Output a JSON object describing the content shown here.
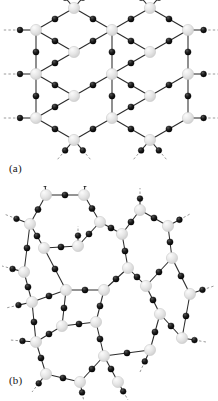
{
  "figure": {
    "background_color": "#ffffff",
    "panels": [
      {
        "id": "a",
        "label": "(a)",
        "caption_text": "(a)",
        "structure_name": "crystalline-honeycomb-network"
      },
      {
        "id": "b",
        "label": "(b)",
        "caption_text": "(b)",
        "structure_name": "amorphous-continuous-random-network"
      }
    ]
  },
  "style": {
    "node_large_fill": "#e2e2e2",
    "node_large_stroke": "#c9c9c9",
    "node_large_highlight": "#f7f7f7",
    "node_small_fill": "#161616",
    "node_small_stroke": "#000000",
    "bond_color": "#2b2b2b",
    "dangling_bond_color": "#9a9a9a",
    "label_color": "#151515"
  },
  "chart_data": {
    "type": "diagram",
    "title": "",
    "subtitle": "",
    "xlabel": "",
    "ylabel": "",
    "legend": [],
    "grid": false,
    "panels": [
      {
        "id": "a",
        "label": "(a)",
        "description": "Regular crystalline honeycomb network of three-fold coordinated large atoms bridged by small atoms; all rings are six-membered.",
        "ring_sizes": [
          6,
          6,
          6,
          6,
          6,
          6,
          6,
          6,
          6
        ],
        "ring_size_counts": {
          "6": 9
        },
        "coordination_number": 3,
        "large_nodes": [
          {
            "id": "A0",
            "x": 36,
            "y": 30
          },
          {
            "id": "A1",
            "x": 36,
            "y": 74
          },
          {
            "id": "A2",
            "x": 36,
            "y": 118
          },
          {
            "id": "A3",
            "x": 74,
            "y": 8
          },
          {
            "id": "A4",
            "x": 74,
            "y": 52
          },
          {
            "id": "A5",
            "x": 74,
            "y": 96
          },
          {
            "id": "A6",
            "x": 74,
            "y": 140
          },
          {
            "id": "A7",
            "x": 112,
            "y": 30
          },
          {
            "id": "A8",
            "x": 112,
            "y": 74
          },
          {
            "id": "A9",
            "x": 112,
            "y": 118
          },
          {
            "id": "A10",
            "x": 150,
            "y": 8
          },
          {
            "id": "A11",
            "x": 150,
            "y": 52
          },
          {
            "id": "A12",
            "x": 150,
            "y": 96
          },
          {
            "id": "A13",
            "x": 150,
            "y": 140
          },
          {
            "id": "A14",
            "x": 188,
            "y": 30
          },
          {
            "id": "A15",
            "x": 188,
            "y": 74
          },
          {
            "id": "A16",
            "x": 188,
            "y": 118
          }
        ],
        "bonds": [
          {
            "from": "A0",
            "to": "A3"
          },
          {
            "from": "A0",
            "to": "A4"
          },
          {
            "from": "A4",
            "to": "A7"
          },
          {
            "from": "A3",
            "to": "A7"
          },
          {
            "from": "A0",
            "to": "A1"
          },
          {
            "from": "A1",
            "to": "A4"
          },
          {
            "from": "A1",
            "to": "A5"
          },
          {
            "from": "A5",
            "to": "A8"
          },
          {
            "from": "A7",
            "to": "A8"
          },
          {
            "from": "A1",
            "to": "A2"
          },
          {
            "from": "A2",
            "to": "A5"
          },
          {
            "from": "A2",
            "to": "A6"
          },
          {
            "from": "A6",
            "to": "A9"
          },
          {
            "from": "A8",
            "to": "A9"
          },
          {
            "from": "A7",
            "to": "A10"
          },
          {
            "from": "A7",
            "to": "A11"
          },
          {
            "from": "A11",
            "to": "A14"
          },
          {
            "from": "A10",
            "to": "A14"
          },
          {
            "from": "A8",
            "to": "A11"
          },
          {
            "from": "A8",
            "to": "A12"
          },
          {
            "from": "A12",
            "to": "A15"
          },
          {
            "from": "A14",
            "to": "A15"
          },
          {
            "from": "A9",
            "to": "A12"
          },
          {
            "from": "A9",
            "to": "A13"
          },
          {
            "from": "A13",
            "to": "A16"
          },
          {
            "from": "A15",
            "to": "A16"
          }
        ],
        "dangling_bonds": [
          {
            "from": "A0",
            "dx": -34,
            "dy": 0
          },
          {
            "from": "A1",
            "dx": -34,
            "dy": 0
          },
          {
            "from": "A2",
            "dx": -34,
            "dy": 0
          },
          {
            "from": "A3",
            "dx": -17,
            "dy": -20
          },
          {
            "from": "A3",
            "dx": 17,
            "dy": -20
          },
          {
            "from": "A10",
            "dx": -17,
            "dy": -20
          },
          {
            "from": "A10",
            "dx": 17,
            "dy": -20
          },
          {
            "from": "A6",
            "dx": -17,
            "dy": 20
          },
          {
            "from": "A6",
            "dx": 17,
            "dy": 20
          },
          {
            "from": "A13",
            "dx": -17,
            "dy": 20
          },
          {
            "from": "A13",
            "dx": 17,
            "dy": 20
          },
          {
            "from": "A14",
            "dx": 30,
            "dy": 0
          },
          {
            "from": "A15",
            "dx": 30,
            "dy": 0
          },
          {
            "from": "A16",
            "dx": 30,
            "dy": 0
          }
        ]
      },
      {
        "id": "b",
        "label": "(b)",
        "description": "Amorphous continuous random network with identical three-fold local coordination but a distribution of ring sizes including four-, five-, six-, seven- and eight-membered rings.",
        "ring_sizes": [
          4,
          5,
          5,
          6,
          6,
          7,
          7,
          8
        ],
        "ring_size_counts": {
          "4": 1,
          "5": 2,
          "6": 2,
          "7": 2,
          "8": 1
        },
        "coordination_number": 3,
        "large_nodes": [
          {
            "id": "B0",
            "x": 30,
            "y": 38
          },
          {
            "id": "B1",
            "x": 46,
            "y": 9
          },
          {
            "id": "B2",
            "x": 84,
            "y": 9
          },
          {
            "id": "B3",
            "x": 100,
            "y": 36
          },
          {
            "id": "B4",
            "x": 78,
            "y": 60
          },
          {
            "id": "B5",
            "x": 44,
            "y": 62
          },
          {
            "id": "B6",
            "x": 24,
            "y": 86
          },
          {
            "id": "B7",
            "x": 32,
            "y": 116
          },
          {
            "id": "B8",
            "x": 66,
            "y": 104
          },
          {
            "id": "B9",
            "x": 62,
            "y": 140
          },
          {
            "id": "B10",
            "x": 36,
            "y": 156
          },
          {
            "id": "B11",
            "x": 46,
            "y": 188
          },
          {
            "id": "B12",
            "x": 80,
            "y": 196
          },
          {
            "id": "B13",
            "x": 104,
            "y": 170
          },
          {
            "id": "B14",
            "x": 96,
            "y": 136
          },
          {
            "id": "B15",
            "x": 104,
            "y": 104
          },
          {
            "id": "B16",
            "x": 128,
            "y": 82
          },
          {
            "id": "B17",
            "x": 122,
            "y": 48
          },
          {
            "id": "B18",
            "x": 140,
            "y": 24
          },
          {
            "id": "B19",
            "x": 168,
            "y": 40
          },
          {
            "id": "B20",
            "x": 172,
            "y": 72
          },
          {
            "id": "B21",
            "x": 146,
            "y": 100
          },
          {
            "id": "B22",
            "x": 160,
            "y": 128
          },
          {
            "id": "B23",
            "x": 190,
            "y": 108
          },
          {
            "id": "B24",
            "x": 150,
            "y": 164
          },
          {
            "id": "B25",
            "x": 182,
            "y": 152
          },
          {
            "id": "B26",
            "x": 118,
            "y": 196
          }
        ],
        "bonds": [
          {
            "from": "B0",
            "to": "B1"
          },
          {
            "from": "B1",
            "to": "B2"
          },
          {
            "from": "B2",
            "to": "B3"
          },
          {
            "from": "B3",
            "to": "B4"
          },
          {
            "from": "B4",
            "to": "B5"
          },
          {
            "from": "B5",
            "to": "B0"
          },
          {
            "from": "B0",
            "to": "B6"
          },
          {
            "from": "B6",
            "to": "B7"
          },
          {
            "from": "B7",
            "to": "B8"
          },
          {
            "from": "B8",
            "to": "B5"
          },
          {
            "from": "B7",
            "to": "B10"
          },
          {
            "from": "B10",
            "to": "B9"
          },
          {
            "from": "B9",
            "to": "B8"
          },
          {
            "from": "B10",
            "to": "B11"
          },
          {
            "from": "B11",
            "to": "B12"
          },
          {
            "from": "B12",
            "to": "B13"
          },
          {
            "from": "B13",
            "to": "B14"
          },
          {
            "from": "B14",
            "to": "B9"
          },
          {
            "from": "B14",
            "to": "B15"
          },
          {
            "from": "B15",
            "to": "B8"
          },
          {
            "from": "B15",
            "to": "B16"
          },
          {
            "from": "B16",
            "to": "B17"
          },
          {
            "from": "B17",
            "to": "B3"
          },
          {
            "from": "B17",
            "to": "B18"
          },
          {
            "from": "B18",
            "to": "B19"
          },
          {
            "from": "B19",
            "to": "B20"
          },
          {
            "from": "B20",
            "to": "B21"
          },
          {
            "from": "B21",
            "to": "B16"
          },
          {
            "from": "B20",
            "to": "B23"
          },
          {
            "from": "B21",
            "to": "B22"
          },
          {
            "from": "B22",
            "to": "B25"
          },
          {
            "from": "B25",
            "to": "B23"
          },
          {
            "from": "B22",
            "to": "B24"
          },
          {
            "from": "B24",
            "to": "B13"
          },
          {
            "from": "B13",
            "to": "B26"
          }
        ],
        "dangling_bonds": [
          {
            "from": "B1",
            "dx": -2,
            "dy": -22
          },
          {
            "from": "B2",
            "dx": 2,
            "dy": -22
          },
          {
            "from": "B0",
            "dx": -26,
            "dy": -10
          },
          {
            "from": "B6",
            "dx": -22,
            "dy": -6
          },
          {
            "from": "B7",
            "dx": -26,
            "dy": 6
          },
          {
            "from": "B10",
            "dx": -26,
            "dy": -2
          },
          {
            "from": "B11",
            "dx": -14,
            "dy": 18
          },
          {
            "from": "B12",
            "dx": 4,
            "dy": 20
          },
          {
            "from": "B18",
            "dx": 0,
            "dy": -22
          },
          {
            "from": "B19",
            "dx": 22,
            "dy": -12
          },
          {
            "from": "B23",
            "dx": 24,
            "dy": -8
          },
          {
            "from": "B25",
            "dx": 24,
            "dy": 4
          },
          {
            "from": "B24",
            "dx": -10,
            "dy": 22
          },
          {
            "from": "B26",
            "dx": 10,
            "dy": 18
          },
          {
            "from": "B4",
            "dx": 0,
            "dy": -20
          }
        ]
      }
    ]
  }
}
